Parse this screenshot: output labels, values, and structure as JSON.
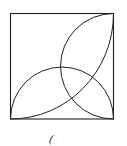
{
  "diagram": {
    "type": "geometry",
    "stroke_color": "#222222",
    "square": {
      "x": 10.5,
      "y": 13.5,
      "size": 103
    },
    "shapes": [
      "square",
      "semicircle-bottom-edge",
      "semicircle-right-edge",
      "arc-bottom-left-to-top-right"
    ],
    "caption": "("
  }
}
